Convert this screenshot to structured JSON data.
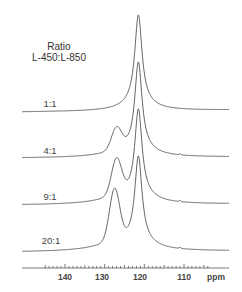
{
  "chart_data": {
    "type": "line",
    "title": "",
    "legend_title": [
      "Ratio",
      "L-450:L-850"
    ],
    "xlabel": "ppm",
    "ylabel": "",
    "xlim": [
      145,
      104
    ],
    "x_reversed": true,
    "x_ticks": [
      140,
      130,
      120,
      110
    ],
    "x_tick_labels": [
      "140",
      "130",
      "120",
      "110"
    ],
    "minor_tick_step": 1,
    "grid": false,
    "stacked_offsets": true,
    "series": [
      {
        "name": "1:1",
        "main_peak_ppm": 121.5,
        "main_peak_rel_height": 1.0,
        "shoulder_ppm": null,
        "shoulder_rel_height": 0.0
      },
      {
        "name": "4:1",
        "main_peak_ppm": 121.5,
        "main_peak_rel_height": 1.0,
        "shoulder_ppm": 127,
        "shoulder_rel_height": 0.27
      },
      {
        "name": "9:1",
        "main_peak_ppm": 121.5,
        "main_peak_rel_height": 1.0,
        "shoulder_ppm": 127,
        "shoulder_rel_height": 0.45
      },
      {
        "name": "20:1",
        "main_peak_ppm": 121.5,
        "main_peak_rel_height": 1.0,
        "shoulder_ppm": 127.5,
        "shoulder_rel_height": 0.65
      }
    ],
    "small_feature_ppm": 111
  },
  "labels": {
    "legend_line1": "Ratio",
    "legend_line2": "L-450:L-850",
    "ratios": [
      "1:1",
      "4:1",
      "9:1",
      "20:1"
    ],
    "ticks": [
      "140",
      "130",
      "120",
      "110"
    ],
    "unit": "ppm"
  }
}
